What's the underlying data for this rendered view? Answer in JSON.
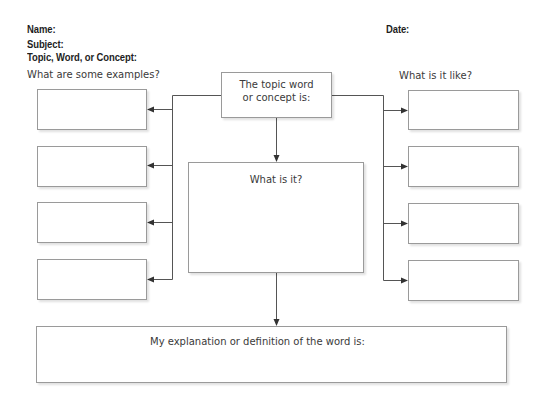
{
  "header": {
    "name_label": "Name:",
    "date_label": "Date:",
    "subject_label": "Subject:",
    "topic_label": "Topic, Word, or Concept:"
  },
  "left_column": {
    "caption": "What are some examples?",
    "boxes": [
      "",
      "",
      "",
      ""
    ]
  },
  "right_column": {
    "caption": "What is it like?",
    "boxes": [
      "",
      "",
      "",
      ""
    ]
  },
  "center": {
    "topic_box_line1": "The topic word",
    "topic_box_line2": "or concept is:",
    "what_is_it_label": "What is it?"
  },
  "bottom": {
    "definition_label": "My explanation or definition of the word is:"
  },
  "colors": {
    "line": "#555555",
    "box_border": "#9a9a9a",
    "text": "#3a3a3a"
  }
}
